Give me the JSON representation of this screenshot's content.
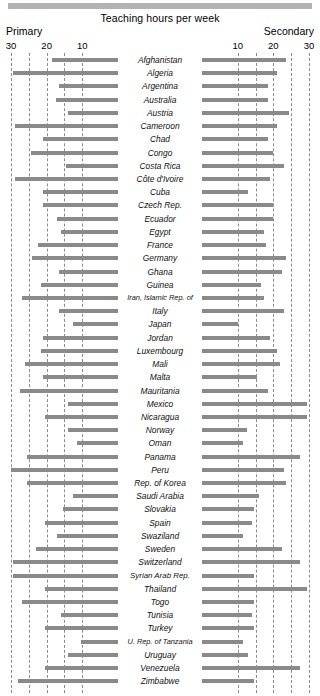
{
  "chart": {
    "title": "Teaching hours per week",
    "left_caption": "Primary",
    "right_caption": "Secondary"
  },
  "axis": {
    "left_ticks": [
      "30",
      "20",
      "10"
    ],
    "right_ticks": [
      "10",
      "20",
      "30"
    ]
  },
  "chart_data": {
    "type": "bar",
    "title": "Teaching hours per week",
    "subtype": "diverging-horizontal",
    "xlabel": "",
    "ylabel": "",
    "grid": true,
    "legend_position": "none",
    "left_axis": {
      "name": "Primary",
      "range": [
        30,
        0
      ],
      "direction": "right-to-left",
      "ticks": [
        30,
        25,
        20,
        15,
        10
      ],
      "labeled_ticks": [
        30,
        20,
        10
      ]
    },
    "right_axis": {
      "name": "Secondary",
      "range": [
        0,
        30
      ],
      "direction": "left-to-right",
      "ticks": [
        10,
        15,
        20,
        25,
        30
      ],
      "labeled_ticks": [
        10,
        20,
        30
      ]
    },
    "categories": [
      "Afghanistan",
      "Algeria",
      "Argentina",
      "Australia",
      "Austria",
      "Cameroon",
      "Chad",
      "Congo",
      "Costa Rica",
      "Côte d'Ivoire",
      "Cuba",
      "Czech Rep.",
      "Ecuador",
      "Egypt",
      "France",
      "Germany",
      "Ghana",
      "Guinea",
      "Iran, Islamic Rep. of",
      "Italy",
      "Japan",
      "Jordan",
      "Luxembourg",
      "Mali",
      "Malta",
      "Mauritania",
      "Mexico",
      "Nicaragua",
      "Norway",
      "Oman",
      "Panama",
      "Peru",
      "Rep. of Korea",
      "Saudi Arabia",
      "Slovakia",
      "Spain",
      "Swaziland",
      "Sweden",
      "Switzerland",
      "Syrian Arab Rep.",
      "Thailand",
      "Togo",
      "Tunisia",
      "Turkey",
      "U. Rep. of Tanzania",
      "Uruguay",
      "Venezuela",
      "Zimbabwe"
    ],
    "series": [
      {
        "name": "Primary",
        "side": "left",
        "values": [
          18.5,
          29.5,
          16.5,
          17.5,
          14.0,
          29.0,
          21.0,
          24.5,
          14.5,
          29.0,
          21.0,
          21.0,
          17.0,
          16.0,
          22.5,
          24.0,
          16.5,
          21.5,
          27.0,
          16.5,
          12.5,
          21.0,
          21.5,
          26.0,
          21.0,
          27.5,
          14.0,
          20.5,
          14.0,
          11.5,
          25.5,
          30.0,
          25.5,
          12.5,
          15.5,
          20.5,
          17.0,
          23.0,
          29.5,
          29.5,
          20.5,
          27.0,
          16.0,
          20.5,
          10.5,
          14.0,
          20.5,
          28.0
        ]
      },
      {
        "name": "Secondary",
        "side": "right",
        "values": [
          23.5,
          21.0,
          18.5,
          18.5,
          24.5,
          21.0,
          18.5,
          20.0,
          23.0,
          19.0,
          13.0,
          20.0,
          20.0,
          17.5,
          18.0,
          23.5,
          22.5,
          16.5,
          17.5,
          23.0,
          10.0,
          19.0,
          21.0,
          22.0,
          15.5,
          18.5,
          29.5,
          29.5,
          12.5,
          11.5,
          27.5,
          23.0,
          23.5,
          16.0,
          14.5,
          14.0,
          11.5,
          22.5,
          27.5,
          14.5,
          29.5,
          14.5,
          14.0,
          14.5,
          11.5,
          13.0,
          27.5,
          14.5
        ]
      }
    ]
  }
}
